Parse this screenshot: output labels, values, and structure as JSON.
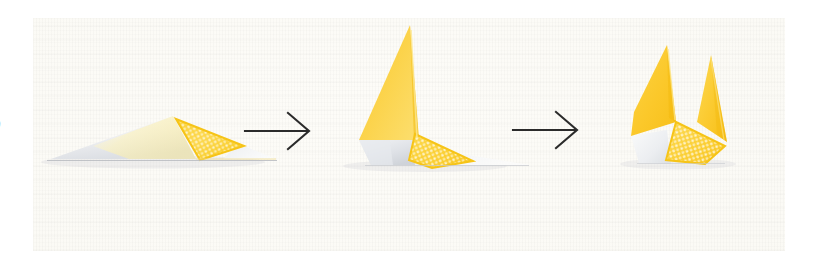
{
  "page": {
    "page_number_partial": "0",
    "background_color": "#ffffff"
  },
  "photo": {
    "description": "Photograph of a three-step origami folding sequence on woven off-white fabric",
    "background_color": "#fbfaf5",
    "surface": "woven-linen-fabric"
  },
  "palette": {
    "yellow_solid": "#fbc82a",
    "yellow_light": "#fdd94f",
    "yellow_pale": "#fde79c",
    "yellow_pattern_dot": "#ffffff",
    "paper_white": "#f7f7f5",
    "paper_shadow": "#e3e5e8",
    "paper_grey": "#d9dce0",
    "arrow_color": "#2b2b2b",
    "fabric": "#fbfaf5"
  },
  "sequence": {
    "step_count": 3,
    "arrow_count": 2,
    "arrows": [
      {
        "name": "arrow-1",
        "symbol": "⟶",
        "direction": "right"
      },
      {
        "name": "arrow-2",
        "symbol": "⟶",
        "direction": "right"
      }
    ],
    "steps": [
      {
        "index": 1,
        "label": "1",
        "name": "origami-step-1",
        "state": "flat-folded triangle lying on surface",
        "features": [
          "long white paper wing extending left",
          "patterned yellow triangle at centre-right",
          "thin grey fold line along the base"
        ]
      },
      {
        "index": 2,
        "label": "2",
        "name": "origami-step-2",
        "state": "one point lifted upright forming a tall yellow fin",
        "features": [
          "tall solid yellow triangular fin pointing up",
          "patterned yellow panel below right",
          "white paper tail extending right",
          "grey shaded underside at lower left"
        ]
      },
      {
        "index": 3,
        "label": "3",
        "name": "origami-step-3",
        "state": "both points raised forming a compact two-peak shape",
        "features": [
          "left solid yellow peak",
          "right solid yellow peak",
          "patterned yellow body between the peaks",
          "small white paper edge at lower left"
        ]
      }
    ]
  }
}
